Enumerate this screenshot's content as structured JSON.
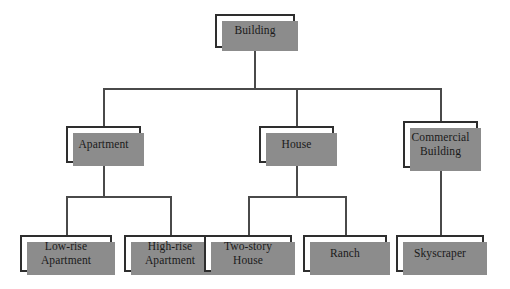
{
  "diagram": {
    "type": "tree",
    "colors": {
      "background": "#ffffff",
      "box_fill": "#ffffff",
      "box_border": "#2e2e2e",
      "shadow": "#8c8c8c",
      "connector": "#4a4a4a",
      "text": "#1a1a1a"
    },
    "levels": [
      {
        "level": 1,
        "nodes": [
          {
            "id": "building",
            "label": "Building"
          }
        ]
      },
      {
        "level": 2,
        "nodes": [
          {
            "id": "apartment",
            "label": "Apartment"
          },
          {
            "id": "house",
            "label": "House"
          },
          {
            "id": "commercial-building",
            "label": "Commercial\nBuilding"
          }
        ]
      },
      {
        "level": 3,
        "nodes": [
          {
            "id": "low-rise-apartment",
            "label": "Low-rise\nApartment"
          },
          {
            "id": "high-rise-apartment",
            "label": "High-rise\nApartment"
          },
          {
            "id": "two-story-house",
            "label": "Two-story\nHouse"
          },
          {
            "id": "ranch",
            "label": "Ranch"
          },
          {
            "id": "skyscraper",
            "label": "Skyscraper"
          }
        ]
      }
    ],
    "edges": [
      {
        "from": "building",
        "to": "apartment"
      },
      {
        "from": "building",
        "to": "house"
      },
      {
        "from": "building",
        "to": "commercial-building"
      },
      {
        "from": "apartment",
        "to": "low-rise-apartment"
      },
      {
        "from": "apartment",
        "to": "high-rise-apartment"
      },
      {
        "from": "house",
        "to": "two-story-house"
      },
      {
        "from": "house",
        "to": "ranch"
      },
      {
        "from": "commercial-building",
        "to": "skyscraper"
      }
    ]
  }
}
